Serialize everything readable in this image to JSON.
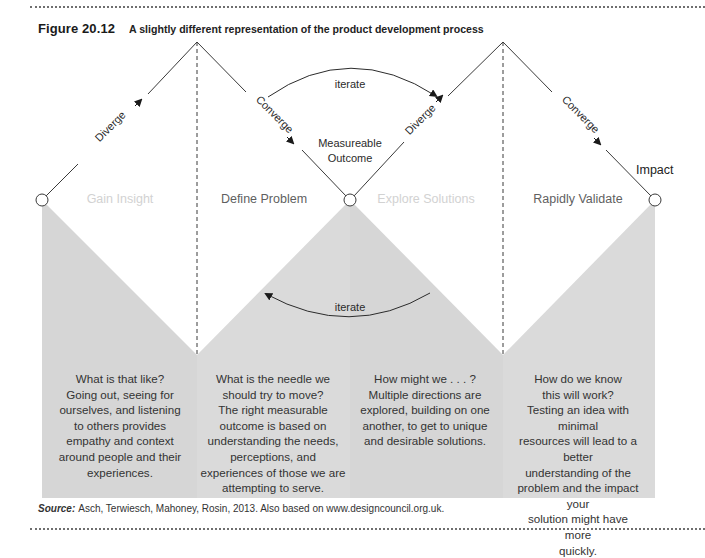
{
  "figure": {
    "number": "Figure 20.12",
    "title": "A slightly different representation of the product development process"
  },
  "phases": [
    {
      "label": "Gain Insight",
      "style": "faint",
      "description": [
        "What is that like?",
        "Going out, seeing for",
        "ourselves, and listening",
        "to others provides",
        "empathy and context",
        "around people and their",
        "experiences."
      ]
    },
    {
      "label": "Define Problem",
      "style": "dark",
      "description": [
        "What is the needle we",
        "should try to move?",
        "The right measurable",
        "outcome is based on",
        "understanding the needs,",
        "perceptions, and",
        "experiences of those we are",
        "attempting to serve."
      ]
    },
    {
      "label": "Explore Solutions",
      "style": "faint",
      "description": [
        "How might we . . . ?",
        "Multiple directions are",
        "explored, building on one",
        "another, to get to unique",
        "and desirable solutions."
      ]
    },
    {
      "label": "Rapidly Validate",
      "style": "dark",
      "description": [
        "How do we know",
        "this will work?",
        "Testing an idea with minimal",
        "resources will lead to a better",
        "understanding of the",
        "problem and the impact your",
        "solution might have more",
        "quickly."
      ]
    }
  ],
  "edge_labels": {
    "diverge_1": "Diverge",
    "converge_1": "Converge",
    "diverge_2": "Diverge",
    "converge_2": "Converge"
  },
  "annotations": {
    "iterate_top": "iterate",
    "iterate_bottom": "iterate",
    "measurable_outcome_line1": "Measureable",
    "measurable_outcome_line2": "Outcome",
    "impact": "Impact"
  },
  "source": {
    "label": "Source:",
    "text": "Asch, Terwiesch, Mahoney, Rosin, 2013. Also based on www.designcouncil.org.uk."
  },
  "colors": {
    "grey_fill": "#d6d6d6",
    "grey_fill_alt": "#dcdcdc",
    "line": "#3a3a3a",
    "faint_text": "#d2d2d2",
    "dark_label": "#5f5f5f"
  }
}
